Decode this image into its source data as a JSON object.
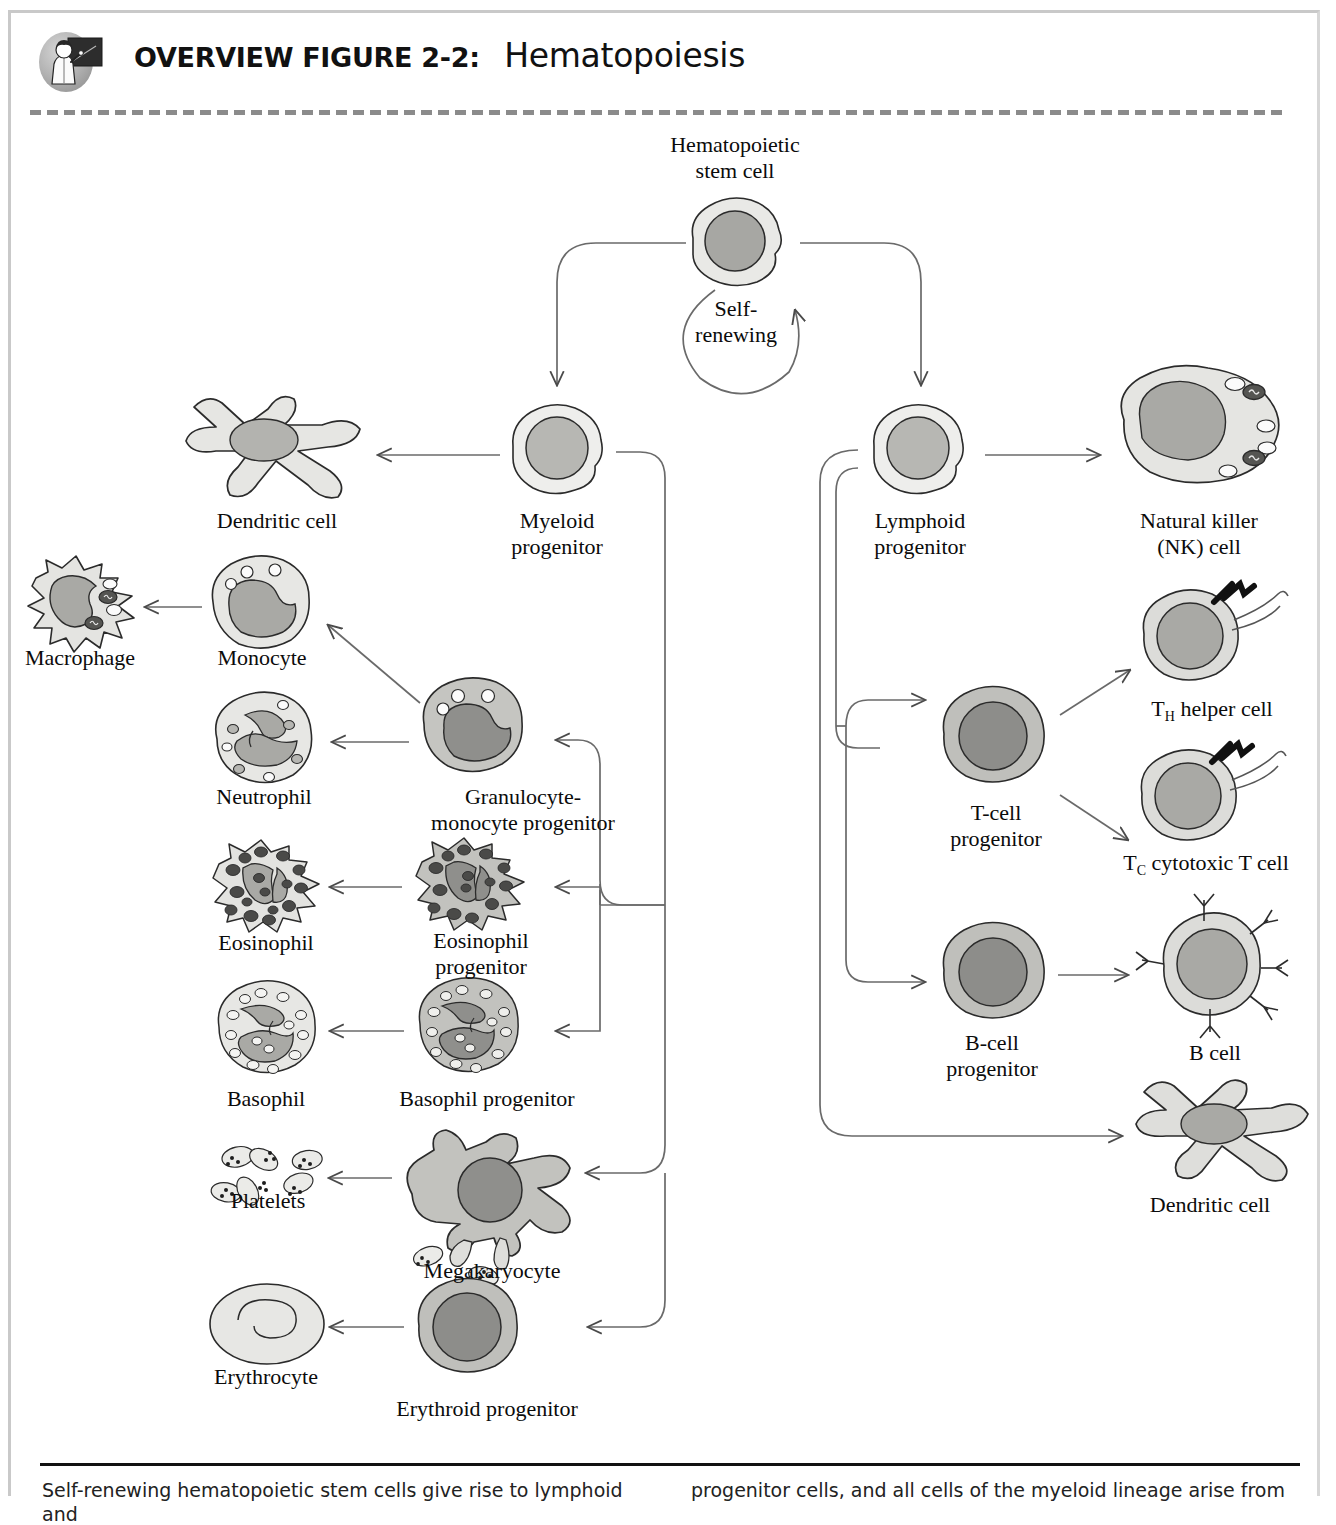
{
  "header": {
    "icon_name": "teacher-chalkboard-icon",
    "label": "OVERVIEW FIGURE 2-2:",
    "title": "Hematopoiesis"
  },
  "diagram": {
    "type": "flowchart",
    "nodes": [
      {
        "id": "hsc",
        "label": "Hematopoietic\nstem cell",
        "cell": "round-stem",
        "x": 735,
        "y": 248
      },
      {
        "id": "self_renew",
        "label": "Self-\nrenewing",
        "cell": "none",
        "x": 735,
        "y": 325
      },
      {
        "id": "myeloid",
        "label": "Myeloid\nprogenitor",
        "cell": "round-light",
        "x": 557,
        "y": 448
      },
      {
        "id": "lymphoid",
        "label": "Lymphoid\nprogenitor",
        "cell": "round-light",
        "x": 920,
        "y": 448
      },
      {
        "id": "dendritic_m",
        "label": "Dendritic cell",
        "cell": "dendritic",
        "x": 272,
        "y": 452
      },
      {
        "id": "nk",
        "label": "Natural killer\n(NK) cell",
        "cell": "nk",
        "x": 1196,
        "y": 440
      },
      {
        "id": "macrophage",
        "label": "Macrophage",
        "cell": "macrophage",
        "x": 78,
        "y": 605
      },
      {
        "id": "monocyte",
        "label": "Monocyte",
        "cell": "monocyte",
        "x": 259,
        "y": 608
      },
      {
        "id": "neutrophil",
        "label": "Neutrophil",
        "cell": "neutrophil",
        "x": 262,
        "y": 741
      },
      {
        "id": "gmp",
        "label": "Granulocyte-\nmonocyte progenitor",
        "cell": "gmp",
        "x": 477,
        "y": 731
      },
      {
        "id": "eosinophil",
        "label": "Eosinophil",
        "cell": "eosinophil",
        "x": 264,
        "y": 887
      },
      {
        "id": "eos_prog",
        "label": "Eosinophil\nprogenitor",
        "cell": "eosinophil-dark",
        "x": 478,
        "y": 884
      },
      {
        "id": "basophil",
        "label": "Basophil",
        "cell": "basophil",
        "x": 262,
        "y": 1031
      },
      {
        "id": "bas_prog",
        "label": "Basophil progenitor",
        "cell": "basophil-dark",
        "x": 478,
        "y": 1031
      },
      {
        "id": "platelets",
        "label": "Platelets",
        "cell": "platelets",
        "x": 266,
        "y": 1168
      },
      {
        "id": "megakaryocyte",
        "label": "Megakaryocyte",
        "cell": "megakaryocyte",
        "x": 487,
        "y": 1192
      },
      {
        "id": "erythrocyte",
        "label": "Erythrocyte",
        "cell": "erythrocyte",
        "x": 265,
        "y": 1318
      },
      {
        "id": "eryth_prog",
        "label": "Erythroid progenitor",
        "cell": "round-dark",
        "x": 480,
        "y": 1345
      },
      {
        "id": "tcell_prog",
        "label": "T-cell\nprogenitor",
        "cell": "round-dark",
        "x": 995,
        "y": 757
      },
      {
        "id": "th",
        "label": "T<sub>H</sub> helper cell",
        "cell": "t-cell",
        "x": 1212,
        "y": 645
      },
      {
        "id": "tc",
        "label": "T<sub>C</sub> cytotoxic T cell",
        "cell": "t-cell",
        "x": 1212,
        "y": 800
      },
      {
        "id": "bcell_prog",
        "label": "B-cell\nprogenitor",
        "cell": "round-dark",
        "x": 993,
        "y": 975
      },
      {
        "id": "bcell",
        "label": "B cell",
        "cell": "b-cell",
        "x": 1210,
        "y": 970
      },
      {
        "id": "dendritic_l",
        "label": "Dendritic cell",
        "cell": "dendritic",
        "x": 1205,
        "y": 1140
      }
    ],
    "edges": [
      {
        "from": "hsc",
        "to": "myeloid",
        "kind": "elbow-down-left"
      },
      {
        "from": "hsc",
        "to": "lymphoid",
        "kind": "elbow-down-right"
      },
      {
        "from": "hsc",
        "to": "hsc",
        "kind": "self-loop",
        "label": "Self-renewing"
      },
      {
        "from": "myeloid",
        "to": "dendritic_m",
        "kind": "straight-left"
      },
      {
        "from": "lymphoid",
        "to": "nk",
        "kind": "straight-right"
      },
      {
        "from": "myeloid",
        "to": "gmp",
        "kind": "bus-left"
      },
      {
        "from": "myeloid",
        "to": "eos_prog",
        "kind": "bus-left"
      },
      {
        "from": "myeloid",
        "to": "bas_prog",
        "kind": "bus-left"
      },
      {
        "from": "myeloid",
        "to": "megakaryocyte",
        "kind": "bus-left"
      },
      {
        "from": "myeloid",
        "to": "eryth_prog",
        "kind": "bus-left"
      },
      {
        "from": "gmp",
        "to": "monocyte",
        "kind": "diagonal-left"
      },
      {
        "from": "gmp",
        "to": "neutrophil",
        "kind": "straight-left"
      },
      {
        "from": "monocyte",
        "to": "macrophage",
        "kind": "straight-left"
      },
      {
        "from": "eos_prog",
        "to": "eosinophil",
        "kind": "straight-left"
      },
      {
        "from": "bas_prog",
        "to": "basophil",
        "kind": "straight-left"
      },
      {
        "from": "megakaryocyte",
        "to": "platelets",
        "kind": "straight-left"
      },
      {
        "from": "eryth_prog",
        "to": "erythrocyte",
        "kind": "straight-left"
      },
      {
        "from": "lymphoid",
        "to": "tcell_prog",
        "kind": "bus-right"
      },
      {
        "from": "lymphoid",
        "to": "bcell_prog",
        "kind": "bus-right"
      },
      {
        "from": "lymphoid",
        "to": "dendritic_l",
        "kind": "bus-right"
      },
      {
        "from": "tcell_prog",
        "to": "th",
        "kind": "diagonal-right"
      },
      {
        "from": "tcell_prog",
        "to": "tc",
        "kind": "diagonal-right"
      },
      {
        "from": "bcell_prog",
        "to": "bcell",
        "kind": "straight-right"
      }
    ],
    "colors": {
      "cyto_light": "#e9e9e6",
      "cyto_mid": "#c9c9c5",
      "cyto_dark": "#b4b4b0",
      "nucleus_light": "#b7b7b3",
      "nucleus_mid": "#a7a7a3",
      "nucleus_dark": "#8f8f8c",
      "granule_dark": "#4a4a48",
      "outline": "#2b2b2b",
      "arrow": "#4a4a4a"
    }
  },
  "footer": {
    "left": "Self-renewing hematopoietic stem cells give rise to lymphoid and",
    "right": "progenitor cells, and all cells of the myeloid lineage arise from"
  }
}
